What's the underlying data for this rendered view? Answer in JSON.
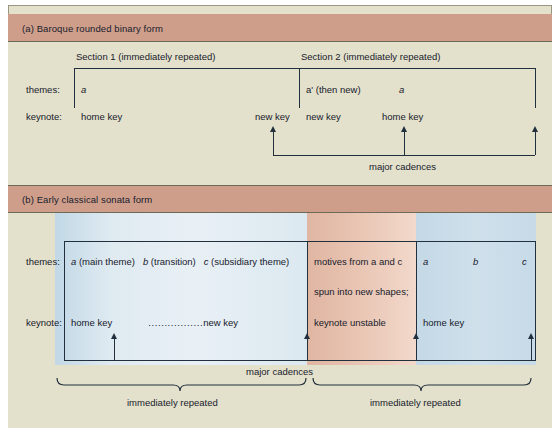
{
  "figure": {
    "panel_a": {
      "band_title": "(a) Baroque rounded binary form",
      "section1_header": "Section 1 (immediately repeated)",
      "section2_header": "Section 2 (immediately repeated)",
      "row_labels": {
        "themes": "themes:",
        "keynote": "keynote:"
      },
      "themes": {
        "s1_a": "a",
        "s2_aprime": "aʹ (then new)",
        "s2_a": "a"
      },
      "keynote": {
        "home_key_1": "home key",
        "new_key_1": "new key",
        "new_key_2": "new key",
        "home_key_2": "home key"
      },
      "cadence_label": "major cadences"
    },
    "panel_b": {
      "band_title": "(b) Early classical sonata form",
      "headers": {
        "exposition": "Exposition",
        "development": "Development",
        "recapitulation": "Recapitulation"
      },
      "row_labels": {
        "themes": "themes:",
        "keynote": "keynote:"
      },
      "themes": {
        "exposition": "a (main theme)   b (transition)   c (subsidiary theme)",
        "exposition_a": "a",
        "exposition_a_rest": " (main theme)",
        "exposition_b": "b",
        "exposition_b_rest": " (transition)",
        "exposition_c": "c",
        "exposition_c_rest": " (subsidiary theme)",
        "development_line1": "motives from a and c",
        "development_line2": "spun into new shapes;",
        "recap_a": "a",
        "recap_b": "b",
        "recap_c": "c"
      },
      "keynote": {
        "exposition_home": "home key",
        "exposition_dots": ".................",
        "exposition_new": "new key",
        "development": "keynote unstable",
        "recapitulation": "home key"
      },
      "cadence_label": "major cadences",
      "brace_left_label": "immediately repeated",
      "brace_right_label": "immediately repeated"
    }
  },
  "colors": {
    "page_bg": "#e3e0cb",
    "band_bg": "#cf9e8b",
    "ink": "#17202b",
    "line": "#22303d",
    "exposition_blue": "#d8e7f0",
    "development_peach": "#e9c4b2",
    "recapitulation_blue": "#c9dce9"
  }
}
